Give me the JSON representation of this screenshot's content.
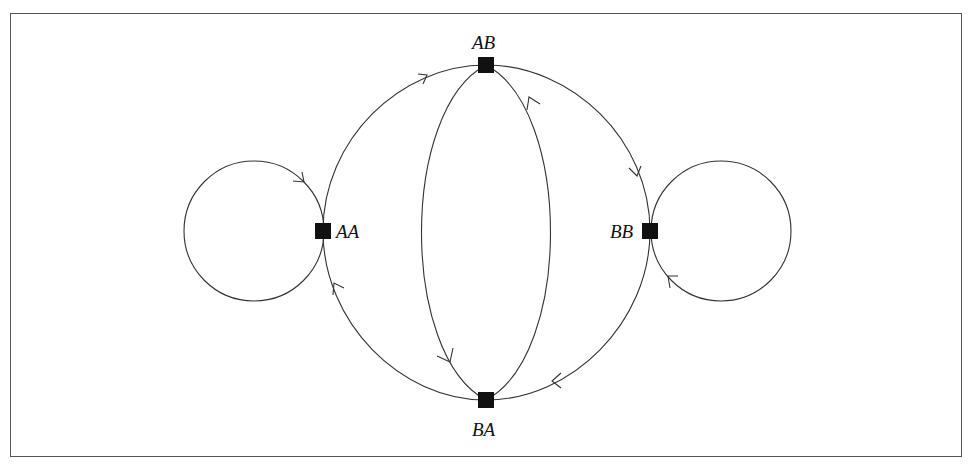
{
  "diagram": {
    "type": "state-transition-graph",
    "nodes": [
      {
        "id": "AB",
        "label": "AB",
        "x": 486,
        "y": 65,
        "label_pos": "above"
      },
      {
        "id": "AA",
        "label": "AA",
        "x": 323,
        "y": 231,
        "label_pos": "right"
      },
      {
        "id": "BB",
        "label": "BB",
        "x": 650,
        "y": 231,
        "label_pos": "left"
      },
      {
        "id": "BA",
        "label": "BA",
        "x": 486,
        "y": 400,
        "label_pos": "below"
      }
    ],
    "edges": [
      {
        "from": "AA",
        "to": "AB",
        "shape": "outer-arc-top-left"
      },
      {
        "from": "AB",
        "to": "BB",
        "shape": "outer-arc-top-right"
      },
      {
        "from": "BB",
        "to": "BA",
        "shape": "outer-arc-bottom-right"
      },
      {
        "from": "BA",
        "to": "AA",
        "shape": "outer-arc-bottom-left"
      },
      {
        "from": "AB",
        "to": "BA",
        "shape": "inner-arc-left"
      },
      {
        "from": "BA",
        "to": "AB",
        "shape": "inner-arc-right"
      },
      {
        "from": "AA",
        "to": "AA",
        "shape": "self-loop-left",
        "direction": "clockwise"
      },
      {
        "from": "BB",
        "to": "BB",
        "shape": "self-loop-right",
        "direction": "clockwise"
      }
    ]
  }
}
